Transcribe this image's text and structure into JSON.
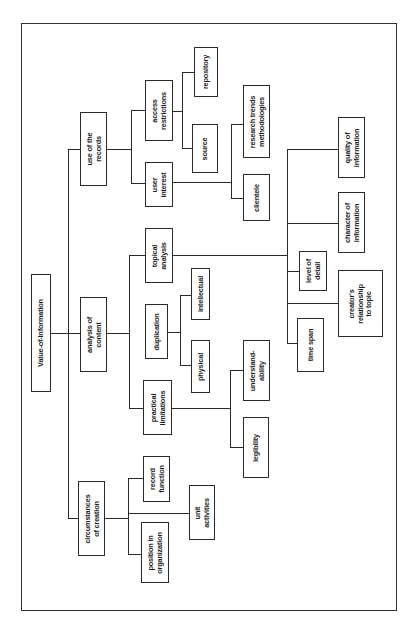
{
  "diagram": {
    "root": "Value-of-Information",
    "nodes": {
      "value_of_information": "Value-of-Information",
      "use_of_records": "use of the\nrecords",
      "analysis_of_content": "analysis of\ncontent",
      "circumstances_of_creation": "circumstances\nof creation",
      "access_restrictions": "access\nrestrictions",
      "user_interest": "user\ninterest",
      "topical_analysis": "topical\nanalysis",
      "duplication": "duplication",
      "practical_limitations": "practical\nlimitations",
      "record_function": "record\nfunction",
      "position_in_organization": "position in\norganization",
      "unit_activities": "unit\nactivities",
      "repository": "repository",
      "source": "source",
      "research_trends": "research trends\nmethodologies",
      "clientele": "clientele",
      "intellectual": "intellectual",
      "physical": "physical",
      "understandability": "understand-\nability",
      "legibility": "legibility",
      "quality_of_information": "quality of\ninformation",
      "character_of_information": "character of\ninformation",
      "level_of_detail": "level of\ndetail",
      "creators_relationship": "creator's\nrelationship\nto topic",
      "time_span": "time span"
    },
    "tree": {
      "Value-of-Information": [
        "use of the records",
        "analysis of content",
        "circumstances of creation"
      ],
      "use of the records": [
        "access restrictions",
        "user interest"
      ],
      "access restrictions": [
        "repository",
        "source"
      ],
      "user interest": [
        "research trends methodologies",
        "clientele"
      ],
      "analysis of content": [
        "topical analysis",
        "duplication",
        "practical limitations"
      ],
      "topical analysis": [
        "quality of information",
        "character of information",
        "level of detail",
        "creator's relationship to topic",
        "time span"
      ],
      "duplication": [
        "intellectual",
        "physical"
      ],
      "practical limitations": [
        "understandability",
        "legibility"
      ],
      "circumstances of creation": [
        "record function",
        "unit activities",
        "position in organization"
      ]
    }
  }
}
